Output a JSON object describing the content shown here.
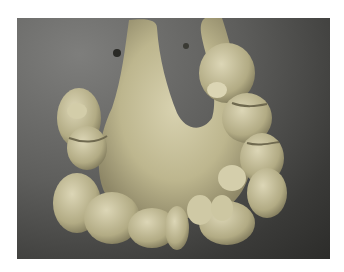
{
  "image": {
    "description": "Photograph of a gross anatomical specimen: a U-shaped mesentery with attached loops of intestine with nodular masses, on a dark gray background",
    "colors": {
      "border": "#ffffff",
      "background_light": "#7e7e7c",
      "background_dark": "#2c2c2a",
      "tissue_light": "#d6d0ac",
      "tissue_mid": "#b9b28a",
      "tissue_shadow": "#8d8666"
    }
  }
}
